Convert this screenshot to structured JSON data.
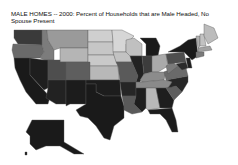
{
  "title": "MALE HOMES -- 2000: Percent of Households that are Male Headed, No Spouse Present",
  "map": {
    "type": "choropleth",
    "region": "United States",
    "palette": {
      "lightest": "#d4d4d4",
      "light": "#b2b2b2",
      "medium": "#8a8a8a",
      "dark": "#5a5a5a",
      "darkest": "#1c1c1c"
    }
  }
}
